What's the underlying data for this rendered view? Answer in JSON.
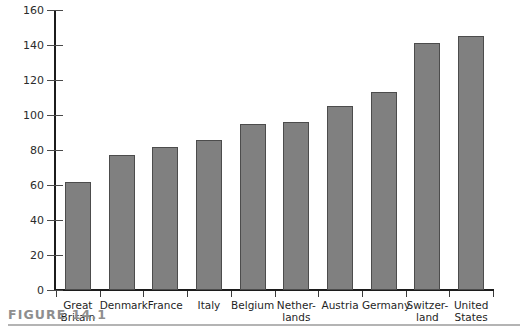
{
  "figure": {
    "caption": "FIGURE 14.1"
  },
  "chart_data": {
    "type": "bar",
    "title": "",
    "subtitle": "",
    "xlabel": "",
    "ylabel": "",
    "ylim": [
      0,
      160
    ],
    "yticks": [
      0,
      20,
      40,
      60,
      80,
      100,
      120,
      140,
      160
    ],
    "ytick_labels": [
      "0",
      "20",
      "40",
      "60",
      "80",
      "100",
      "120",
      "140",
      "160"
    ],
    "grid": false,
    "legend": null,
    "bar_color": "#808080",
    "bar_edge_color": "#4c4c4c",
    "axis_color": "#1c1c1c",
    "categories": [
      "Great Britain",
      "Denmark",
      "France",
      "Italy",
      "Belgium",
      "Netherlands",
      "Austria",
      "Germany",
      "Switzerland",
      "United States"
    ],
    "category_label_lines": [
      [
        "Great",
        "Britain"
      ],
      [
        "Denmark",
        ""
      ],
      [
        "France",
        ""
      ],
      [
        "Italy",
        ""
      ],
      [
        "Belgium",
        ""
      ],
      [
        "Nether-",
        "lands"
      ],
      [
        "Austria",
        ""
      ],
      [
        "Germany",
        ""
      ],
      [
        "Switzer-",
        "land"
      ],
      [
        "United",
        "States"
      ]
    ],
    "values": [
      62,
      77,
      82,
      86,
      95,
      96,
      105,
      113,
      141,
      145
    ]
  }
}
